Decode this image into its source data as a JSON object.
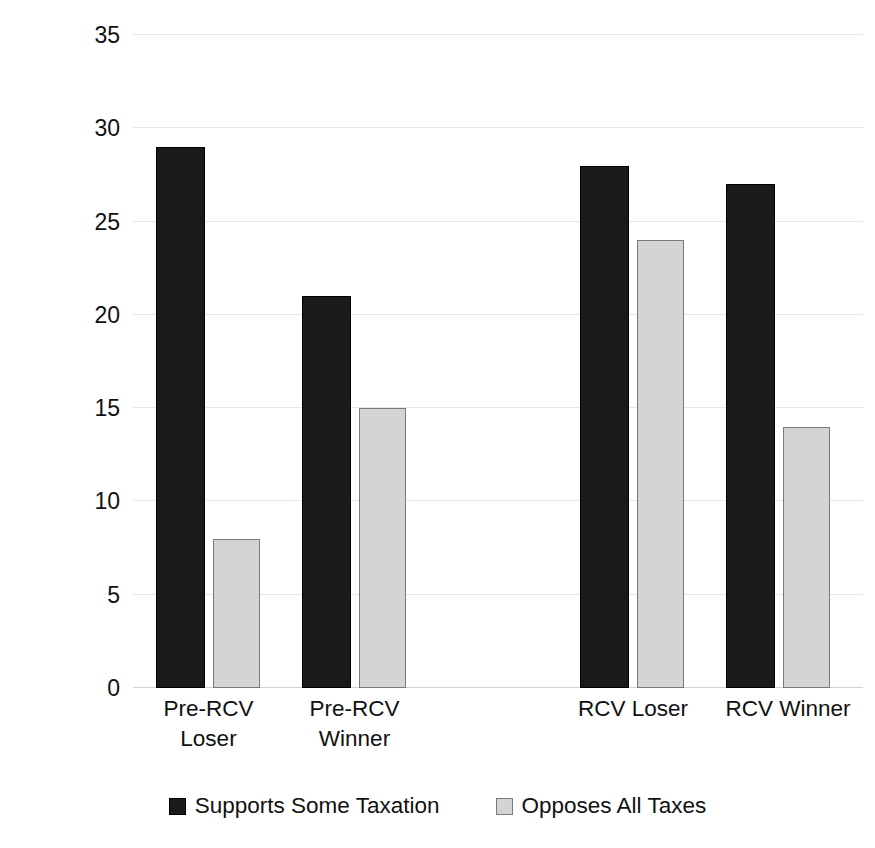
{
  "chart_data": {
    "type": "bar",
    "title": "",
    "xlabel": "",
    "ylabel": "Numberof Candidates",
    "ylim": [
      0,
      35
    ],
    "ytick_step": 5,
    "yticks": [
      35,
      30,
      25,
      20,
      15,
      10,
      5,
      0
    ],
    "categories": [
      "Pre-RCV Loser",
      "Pre-RCV Winner",
      "RCV Loser",
      "RCV Winner"
    ],
    "category_lines": [
      [
        "Pre-RCV",
        "Loser"
      ],
      [
        "Pre-RCV",
        "Winner"
      ],
      [
        "RCV Loser"
      ],
      [
        "RCV Winner"
      ]
    ],
    "series": [
      {
        "name": "Supports Some Taxation",
        "color": "#1a1a1a",
        "values": [
          29,
          21,
          28,
          27
        ]
      },
      {
        "name": "Opposes All Taxes",
        "color": "#d4d4d4",
        "values": [
          8,
          15,
          24,
          14
        ]
      }
    ],
    "legend_position": "bottom",
    "grid": true,
    "gridline_color": "#e4e8ee",
    "background": "#ffffff"
  },
  "bar_layout": [
    {
      "category": 0,
      "series": 0,
      "left": 23,
      "width": 49,
      "value": 29
    },
    {
      "category": 0,
      "series": 1,
      "left": 80,
      "width": 47,
      "value": 8
    },
    {
      "category": 1,
      "series": 0,
      "left": 169,
      "width": 49,
      "value": 21
    },
    {
      "category": 1,
      "series": 1,
      "left": 226,
      "width": 47,
      "value": 15
    },
    {
      "category": 2,
      "series": 0,
      "left": 447,
      "width": 49,
      "value": 28
    },
    {
      "category": 2,
      "series": 1,
      "left": 504,
      "width": 47,
      "value": 24
    },
    {
      "category": 3,
      "series": 0,
      "left": 593,
      "width": 49,
      "value": 27
    },
    {
      "category": 3,
      "series": 1,
      "left": 650,
      "width": 47,
      "value": 14
    }
  ],
  "x_label_layout": [
    {
      "left": 8,
      "width": 135
    },
    {
      "left": 154,
      "width": 135
    },
    {
      "left": 420,
      "width": 160
    },
    {
      "left": 570,
      "width": 170
    }
  ]
}
